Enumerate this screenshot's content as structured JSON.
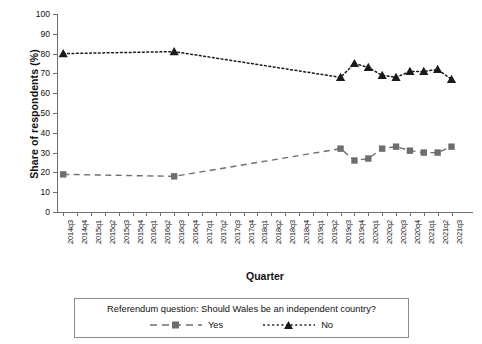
{
  "chart_data": {
    "type": "line",
    "title": "",
    "xlabel": "Quarter",
    "ylabel": "Share of respondents (%)",
    "ylim": [
      0,
      100
    ],
    "ytick_step": 10,
    "yticks": [
      0,
      10,
      20,
      30,
      40,
      50,
      60,
      70,
      80,
      90,
      100
    ],
    "grid": false,
    "legend_position": "bottom",
    "legend_title": "Referendum question: Should Wales be an independent country?",
    "categories": [
      "2014q3",
      "2014q4",
      "2015q1",
      "2015q2",
      "2015q3",
      "2015q4",
      "2016q1",
      "2016q2",
      "2016q3",
      "2016q4",
      "2017q1",
      "2017q2",
      "2017q3",
      "2017q4",
      "2018q1",
      "2018q2",
      "2018q3",
      "2018q4",
      "2019q1",
      "2019q2",
      "2019q3",
      "2019q4",
      "2020q1",
      "2020q2",
      "2020q3",
      "2020q4",
      "2021q1",
      "2021q2",
      "2021q3"
    ],
    "series": [
      {
        "name": "Yes",
        "color": "#6e6e6e",
        "marker": "square",
        "dash": "dashed",
        "values": [
          19,
          null,
          null,
          null,
          null,
          null,
          null,
          null,
          18,
          null,
          null,
          null,
          null,
          null,
          null,
          null,
          null,
          null,
          null,
          null,
          32,
          26,
          27,
          32,
          33,
          31,
          30,
          30,
          33
        ]
      },
      {
        "name": "No",
        "color": "#1a1a1a",
        "marker": "triangle",
        "dash": "dotted",
        "values": [
          80,
          null,
          null,
          null,
          null,
          null,
          null,
          null,
          81,
          null,
          null,
          null,
          null,
          null,
          null,
          null,
          null,
          null,
          null,
          null,
          68,
          75,
          73,
          69,
          68,
          71,
          71,
          72,
          67
        ]
      }
    ]
  },
  "legend": {
    "title": "Referendum question: Should Wales be an independent country?",
    "items": [
      {
        "label": "Yes"
      },
      {
        "label": "No"
      }
    ]
  },
  "axes": {
    "x_title": "Quarter",
    "y_title": "Share of respondents (%)"
  }
}
